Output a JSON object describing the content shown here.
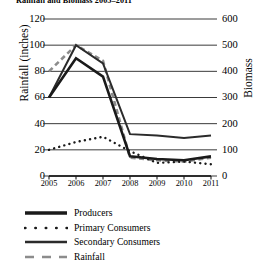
{
  "chart_data": {
    "type": "line",
    "title": "Rainfall and Biomass 2005–2011",
    "xlabel": "",
    "ylabel": "Rainfall (inches)",
    "y2label": "Biomass",
    "x": [
      2005,
      2006,
      2007,
      2008,
      2009,
      2010,
      2011
    ],
    "xticklabels": [
      "2005",
      "2006",
      "2007",
      "2008",
      "2009",
      "2010",
      "2011"
    ],
    "ylim": [
      0,
      120
    ],
    "yticks": [
      0,
      20,
      40,
      60,
      80,
      100,
      120
    ],
    "yticklabels": [
      "0",
      "20",
      "40",
      "60",
      "80",
      "100",
      "120"
    ],
    "y2lim": [
      0,
      600
    ],
    "y2ticks": [
      0,
      100,
      200,
      300,
      400,
      500,
      600
    ],
    "y2ticklabels": [
      "0",
      "100",
      "200",
      "300",
      "400",
      "500",
      "600"
    ],
    "grid": true,
    "legend_position": "below-plot",
    "series": [
      {
        "name": "Producers",
        "axis": "right",
        "style": "solid-thick",
        "color": "#1a1a1a",
        "values_left_scale": [
          60,
          90,
          76,
          15,
          13,
          12,
          15
        ],
        "values": [
          300,
          450,
          380,
          75,
          65,
          60,
          75
        ]
      },
      {
        "name": "Primary Consumers",
        "axis": "right",
        "style": "dotted",
        "color": "#1a1a1a",
        "values_left_scale": [
          20,
          26,
          30,
          19,
          10,
          11,
          9
        ],
        "values": [
          100,
          130,
          150,
          95,
          50,
          55,
          45
        ]
      },
      {
        "name": "Secondary Consumers",
        "axis": "right",
        "style": "solid",
        "color": "#2b2b2b",
        "values_left_scale": [
          60,
          100,
          86,
          32,
          31,
          29,
          31
        ],
        "values": [
          300,
          500,
          430,
          160,
          155,
          145,
          155
        ]
      },
      {
        "name": "Rainfall",
        "axis": "left",
        "style": "dashed",
        "color": "#8c8c8c",
        "values": [
          80,
          100,
          88,
          14,
          12,
          11,
          14
        ]
      }
    ]
  },
  "chart": {
    "title": "Rainfall and Biomass 2005–2011",
    "left_axis_title": "Rainfall (inches)",
    "right_axis_title": "Biomass",
    "left_ticks": [
      "120",
      "100",
      "80",
      "60",
      "40",
      "20",
      "0"
    ],
    "right_ticks": [
      "600",
      "500",
      "400",
      "300",
      "200",
      "100",
      "0"
    ],
    "x_ticks": [
      "2005",
      "2006",
      "2007",
      "2008",
      "2009",
      "2010",
      "2011"
    ]
  },
  "legend": {
    "items": [
      {
        "label": "Producers",
        "style": "solid-thick"
      },
      {
        "label": "Primary Consumers",
        "style": "dotted"
      },
      {
        "label": "Secondary Consumers",
        "style": "solid"
      },
      {
        "label": "Rainfall",
        "style": "dashed"
      }
    ]
  }
}
